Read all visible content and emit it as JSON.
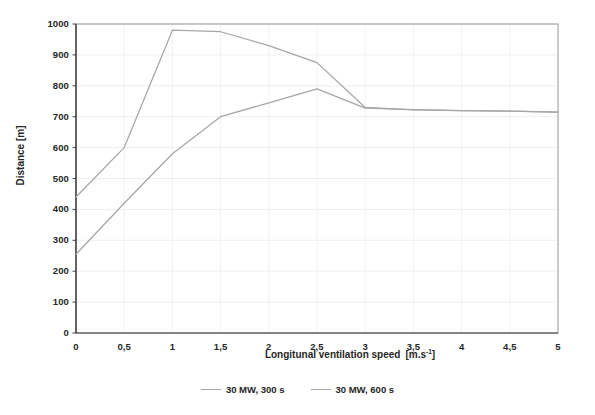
{
  "chart_data": {
    "type": "line",
    "title": "",
    "xlabel": "Longitunal ventilation speed  [m.s-1]",
    "xlabel_main": "Longitunal ventilation speed",
    "xlabel_unit_open": "[m.s",
    "xlabel_unit_exp": "-1",
    "xlabel_unit_close": "]",
    "ylabel": "Distance [m]",
    "x": [
      0,
      0.5,
      1,
      1.5,
      2,
      2.5,
      3,
      3.5,
      4,
      4.5,
      5
    ],
    "xlim": [
      0,
      5
    ],
    "ylim": [
      0,
      1000
    ],
    "xticks": [
      "0",
      "0,5",
      "1",
      "1,5",
      "2",
      "2,5",
      "3",
      "3,5",
      "4",
      "4,5",
      "5"
    ],
    "yticks": [
      "0",
      "100",
      "200",
      "300",
      "400",
      "500",
      "600",
      "700",
      "800",
      "900",
      "1000"
    ],
    "grid": true,
    "legend_position": "bottom",
    "series": [
      {
        "name": "30 MW, 300 s",
        "color": "#a6a6a6",
        "values": [
          440,
          600,
          980,
          975,
          930,
          875,
          730,
          722,
          720,
          718,
          715
        ]
      },
      {
        "name": "30 MW, 600 s",
        "color": "#a6a6a6",
        "values": [
          255,
          420,
          580,
          700,
          745,
          790,
          728,
          723,
          720,
          718,
          715
        ]
      }
    ]
  },
  "legend": {
    "entries": [
      {
        "label": "30 MW, 300 s"
      },
      {
        "label": "30 MW, 600 s"
      }
    ]
  },
  "colors": {
    "series_line": "#a6a6a6",
    "axis": "#595959",
    "grid": "#e6e6e6",
    "text": "#262626",
    "background": "#ffffff"
  }
}
